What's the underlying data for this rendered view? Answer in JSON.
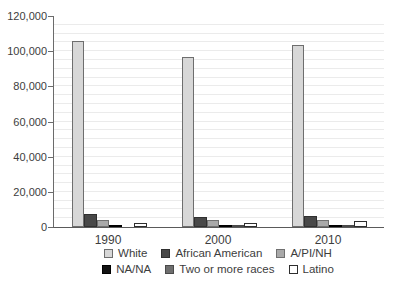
{
  "chart_data": {
    "type": "bar",
    "title": "",
    "xlabel": "",
    "ylabel": "",
    "categories": [
      "1990",
      "2000",
      "2010"
    ],
    "series": [
      {
        "name": "White",
        "values": [
          105500,
          96500,
          103500
        ],
        "fill": "#d7d7d7",
        "stroke": "#6e6e6e"
      },
      {
        "name": "African American",
        "values": [
          7500,
          5800,
          6500
        ],
        "fill": "#484848",
        "stroke": "#303030"
      },
      {
        "name": "A/PI/NH",
        "values": [
          4100,
          3800,
          3800
        ],
        "fill": "#a9a9a9",
        "stroke": "#707070"
      },
      {
        "name": "NA/NA",
        "values": [
          900,
          600,
          600
        ],
        "fill": "#121212",
        "stroke": "#000000"
      },
      {
        "name": "Two or more races",
        "values": [
          0,
          1000,
          1200
        ],
        "fill": "#6e6e6e",
        "stroke": "#4a4a4a"
      },
      {
        "name": "Latino",
        "values": [
          2200,
          2300,
          3600
        ],
        "fill": "#ffffff",
        "stroke": "#2e2e2e"
      }
    ],
    "ylim": [
      0,
      120000
    ],
    "y_major_tick_interval": 20000,
    "y_minor_gridline_interval": 5000,
    "y_tick_labels": [
      "0",
      "20,000",
      "40,000",
      "60,000",
      "80,000",
      "100,000",
      "120,000"
    ],
    "grid": "minor horizontal gridlines on, light gray",
    "legend_position": "bottom, two centered rows",
    "legend_rows": [
      [
        "White",
        "African American",
        "A/PI/NH"
      ],
      [
        "NA/NA",
        "Two or more races",
        "Latino"
      ]
    ]
  },
  "colors": {
    "background": "#ffffff",
    "axis_line": "#6b6b6b",
    "gridline": "#ebebeb",
    "text": "#3d3d3d"
  }
}
